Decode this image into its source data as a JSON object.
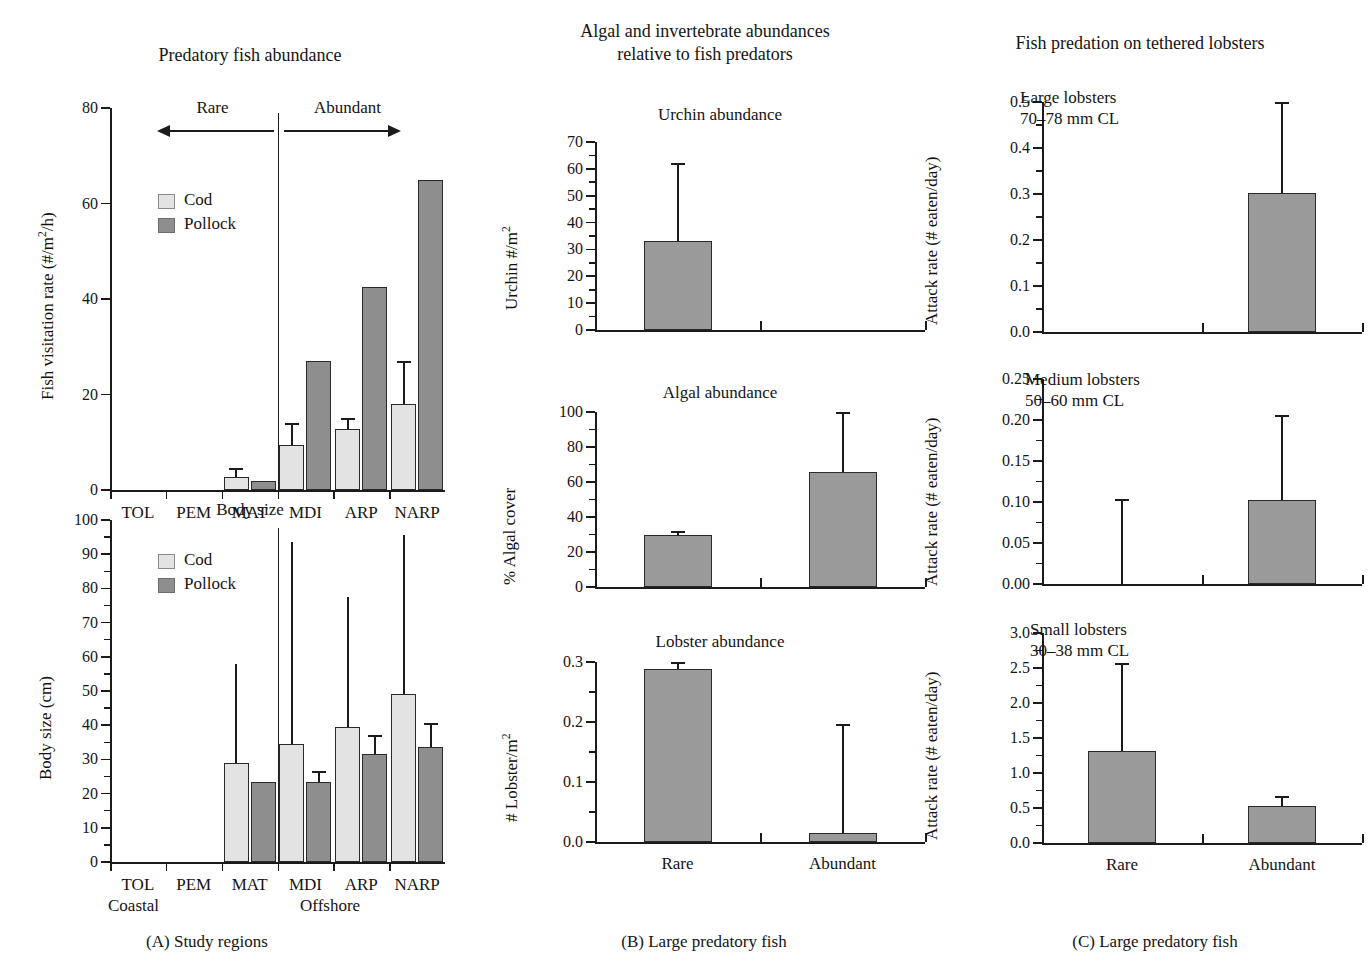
{
  "figure": {
    "panel_a_caption": "(A)  Study regions",
    "panel_b_caption": "(B)  Large predatory fish",
    "panel_c_caption": "(C)  Large predatory fish"
  },
  "panel_a": {
    "column_title": "Predatory fish abundance",
    "region_group_left": "Coastal",
    "region_group_right": "Offshore",
    "annotation_rare": "Rare",
    "annotation_abundant": "Abundant",
    "legend": {
      "cod": "Cod",
      "pollock": "Pollock"
    },
    "chart1": {
      "title": "",
      "ylabel": "Fish visitation rate (#/m2/h)",
      "yticks": [
        "0",
        "20",
        "40",
        "60",
        "80"
      ],
      "categories": [
        "TOL",
        "PEM",
        "MAT",
        "MDI",
        "ARP",
        "NARP"
      ]
    },
    "chart2": {
      "title": "Body size",
      "ylabel": "Body size (cm)",
      "yticks": [
        "0",
        "10",
        "20",
        "30",
        "40",
        "50",
        "60",
        "70",
        "80",
        "90",
        "100"
      ],
      "categories": [
        "TOL",
        "PEM",
        "MAT",
        "MDI",
        "ARP",
        "NARP"
      ]
    }
  },
  "panel_b": {
    "column_title": "Algal and invertebrate abundances\nrelative to fish predators",
    "chart1": {
      "title": "Urchin abundance",
      "ylabel": "Urchin #/m2",
      "yticks": [
        "0",
        "10",
        "20",
        "30",
        "40",
        "50",
        "60",
        "70"
      ]
    },
    "chart2": {
      "title": "Algal abundance",
      "ylabel": "% Algal cover",
      "yticks": [
        "0",
        "20",
        "40",
        "60",
        "80",
        "100"
      ]
    },
    "chart3": {
      "title": "Lobster abundance",
      "ylabel": "# Lobster/m2",
      "yticks": [
        "0.0",
        "0.1",
        "0.2",
        "0.3"
      ]
    },
    "categories": [
      "Rare",
      "Abundant"
    ]
  },
  "panel_c": {
    "column_title": "Fish predation on tethered lobsters",
    "chart1": {
      "note": "Large lobsters\n70–78 mm CL",
      "ylabel": "Attack rate (# eaten/day)",
      "yticks": [
        "0.0",
        "0.1",
        "0.2",
        "0.3",
        "0.4",
        "0.5"
      ]
    },
    "chart2": {
      "note": "Medium lobsters\n50–60 mm CL",
      "ylabel": "Attack rate (# eaten/day)",
      "yticks": [
        "0.00",
        "0.05",
        "0.10",
        "0.15",
        "0.20",
        "0.25"
      ]
    },
    "chart3": {
      "note": "Small lobsters\n30–38 mm CL",
      "ylabel": "Attack rate (# eaten/day)",
      "yticks": [
        "0.0",
        "0.5",
        "1.0",
        "1.5",
        "2.0",
        "2.5",
        "3.0"
      ]
    },
    "categories": [
      "Rare",
      "Abundant"
    ]
  },
  "chart_data": [
    {
      "id": "a1-fish-visitation",
      "type": "bar",
      "title": "Predatory fish abundance",
      "xlabel": "Study regions",
      "ylabel": "Fish visitation rate (#/m²/h)",
      "ylim": [
        0,
        80
      ],
      "yticks": [
        0,
        20,
        40,
        60,
        80
      ],
      "grid": false,
      "legend_position": "upper-left",
      "categories": [
        "TOL",
        "PEM",
        "MAT",
        "MDI",
        "ARP",
        "NARP"
      ],
      "series": [
        {
          "name": "Cod",
          "values": [
            0,
            0,
            2.8,
            9.5,
            12.8,
            18.0
          ],
          "errors": [
            0,
            0,
            1.8,
            4.5,
            2.2,
            9.0
          ]
        },
        {
          "name": "Pollock",
          "values": [
            0,
            0,
            1.8,
            27.0,
            42.5,
            65.0
          ],
          "errors": [
            0,
            0,
            0,
            0,
            0,
            0
          ]
        }
      ],
      "annotations": [
        "Rare",
        "Abundant",
        "Coastal",
        "Offshore"
      ]
    },
    {
      "id": "a2-body-size",
      "type": "bar",
      "title": "Body size",
      "xlabel": "Study regions",
      "ylabel": "Body size (cm)",
      "ylim": [
        0,
        100
      ],
      "yticks": [
        0,
        10,
        20,
        30,
        40,
        50,
        60,
        70,
        80,
        90,
        100
      ],
      "grid": false,
      "legend_position": "upper-left",
      "categories": [
        "TOL",
        "PEM",
        "MAT",
        "MDI",
        "ARP",
        "NARP"
      ],
      "series": [
        {
          "name": "Cod",
          "values": [
            0,
            0,
            29.0,
            34.5,
            39.5,
            49.0
          ],
          "errors": [
            0,
            0,
            29.0,
            59.0,
            38.0,
            46.5
          ]
        },
        {
          "name": "Pollock",
          "values": [
            0,
            0,
            23.5,
            23.5,
            31.5,
            33.5
          ],
          "errors": [
            0,
            0,
            0,
            3.0,
            5.5,
            7.0
          ]
        }
      ],
      "annotations": [
        "Coastal",
        "Offshore"
      ]
    },
    {
      "id": "b1-urchin-abundance",
      "type": "bar",
      "title": "Urchin abundance",
      "xlabel": "Large predatory fish",
      "ylabel": "Urchin #/m²",
      "ylim": [
        0,
        70
      ],
      "yticks": [
        0,
        10,
        20,
        30,
        40,
        50,
        60,
        70
      ],
      "grid": false,
      "categories": [
        "Rare",
        "Abundant"
      ],
      "values": [
        33.0,
        0.0
      ],
      "errors": [
        29.0,
        0.0
      ]
    },
    {
      "id": "b2-algal-abundance",
      "type": "bar",
      "title": "Algal abundance",
      "xlabel": "Large predatory fish",
      "ylabel": "% Algal cover",
      "ylim": [
        0,
        100
      ],
      "yticks": [
        0,
        20,
        40,
        60,
        80,
        100
      ],
      "grid": false,
      "categories": [
        "Rare",
        "Abundant"
      ],
      "values": [
        30.0,
        66.0
      ],
      "errors": [
        2.0,
        35.0
      ]
    },
    {
      "id": "b3-lobster-abundance",
      "type": "bar",
      "title": "Lobster abundance",
      "xlabel": "Large predatory fish",
      "ylabel": "# Lobster/m²",
      "ylim": [
        0,
        0.3
      ],
      "yticks": [
        0.0,
        0.1,
        0.2,
        0.3
      ],
      "grid": false,
      "categories": [
        "Rare",
        "Abundant"
      ],
      "values": [
        0.288,
        0.015
      ],
      "errors": [
        0.012,
        0.182
      ]
    },
    {
      "id": "c1-large-lobsters",
      "type": "bar",
      "title": "Large lobsters 70–78 mm CL",
      "xlabel": "Large predatory fish",
      "ylabel": "Attack rate (# eaten/day)",
      "ylim": [
        0,
        0.5
      ],
      "yticks": [
        0.0,
        0.1,
        0.2,
        0.3,
        0.4,
        0.5
      ],
      "grid": false,
      "categories": [
        "Rare",
        "Abundant"
      ],
      "values": [
        0.0,
        0.303
      ],
      "errors": [
        0.0,
        0.197
      ]
    },
    {
      "id": "c2-medium-lobsters",
      "type": "bar",
      "title": "Medium lobsters 50–60 mm CL",
      "xlabel": "Large predatory fish",
      "ylabel": "Attack rate (# eaten/day)",
      "ylim": [
        0,
        0.25
      ],
      "yticks": [
        0.0,
        0.05,
        0.1,
        0.15,
        0.2,
        0.25
      ],
      "grid": false,
      "categories": [
        "Rare",
        "Abundant"
      ],
      "values": [
        0.0,
        0.103
      ],
      "errors": [
        0.104,
        0.103
      ]
    },
    {
      "id": "c3-small-lobsters",
      "type": "bar",
      "title": "Small lobsters 30–38 mm CL",
      "xlabel": "Large predatory fish",
      "ylabel": "Attack rate (# eaten/day)",
      "ylim": [
        0,
        3.0
      ],
      "yticks": [
        0.0,
        0.5,
        1.0,
        1.5,
        2.0,
        2.5,
        3.0
      ],
      "grid": false,
      "categories": [
        "Rare",
        "Abundant"
      ],
      "values": [
        1.31,
        0.53
      ],
      "errors": [
        1.26,
        0.14
      ]
    }
  ]
}
